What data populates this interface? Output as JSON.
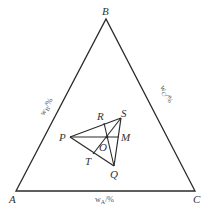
{
  "diagram": {
    "type": "ternary-phase-diagram",
    "stroke_color": "#2a2a2a",
    "vertices": {
      "A": {
        "label": "A",
        "x": 16,
        "y": 191
      },
      "B": {
        "label": "B",
        "x": 106,
        "y": 19
      },
      "C": {
        "label": "C",
        "x": 195,
        "y": 191
      }
    },
    "axis_labels": {
      "left": {
        "main": "w",
        "sub": "B",
        "unit": "/%"
      },
      "right": {
        "main": "w",
        "sub": "C",
        "unit": "/%"
      },
      "bottom": {
        "main": "w",
        "sub": "A",
        "unit": "/%"
      }
    },
    "points": {
      "P": {
        "label": "P",
        "x": 70,
        "y": 137
      },
      "S": {
        "label": "S",
        "x": 121,
        "y": 118
      },
      "Q": {
        "label": "Q",
        "x": 114,
        "y": 166
      },
      "M": {
        "label": "M",
        "x": 119,
        "y": 137
      },
      "R": {
        "label": "R",
        "x": 104,
        "y": 123
      },
      "O": {
        "label": "O",
        "x": 107,
        "y": 137
      },
      "T": {
        "label": "T",
        "x": 93,
        "y": 154
      }
    },
    "segments": [
      [
        "P",
        "S"
      ],
      [
        "P",
        "Q"
      ],
      [
        "S",
        "Q"
      ],
      [
        "P",
        "M"
      ],
      [
        "S",
        "T"
      ],
      [
        "R",
        "Q"
      ]
    ]
  }
}
